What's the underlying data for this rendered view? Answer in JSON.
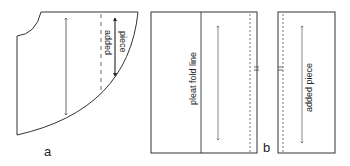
{
  "diagram": {
    "panel_a": {
      "label": "a",
      "added_piece_label_line1": "added",
      "added_piece_label_line2": "piece"
    },
    "panel_b": {
      "label": "b",
      "pleat_fold_label": "pleat fold line",
      "added_piece_label": "added piece"
    },
    "colors": {
      "stroke": "#333333",
      "background": "#ffffff"
    }
  }
}
